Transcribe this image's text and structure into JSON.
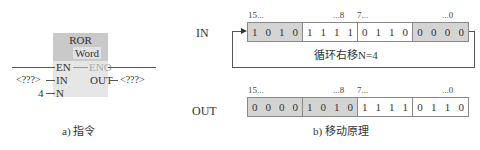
{
  "instruction": {
    "name": "ROR",
    "type": "Word",
    "pins": {
      "en": "EN",
      "eno": "ENO",
      "in": "IN",
      "out": "OUT",
      "n": "N"
    },
    "in_value": "<???>",
    "out_value": "<???>",
    "n_value": "4",
    "caption": "a) 指令"
  },
  "principle": {
    "caption": "b) 移动原理",
    "shift_label": "循环右移N=4",
    "in_row": {
      "label": "IN",
      "headers": [
        "15...",
        "...8",
        "7...",
        "...0"
      ],
      "nibbles": [
        {
          "bits": [
            "1",
            "0",
            "1",
            "0"
          ],
          "shaded": true
        },
        {
          "bits": [
            "1",
            "1",
            "1",
            "1"
          ],
          "shaded": false
        },
        {
          "bits": [
            "0",
            "1",
            "1",
            "0"
          ],
          "shaded": false
        },
        {
          "bits": [
            "0",
            "0",
            "0",
            "0"
          ],
          "shaded": true
        }
      ]
    },
    "out_row": {
      "label": "OUT",
      "headers": [
        "15...",
        "...8",
        "7...",
        "...0"
      ],
      "nibbles": [
        {
          "bits": [
            "0",
            "0",
            "0",
            "0"
          ],
          "shaded": true
        },
        {
          "bits": [
            "1",
            "0",
            "1",
            "0"
          ],
          "shaded": true
        },
        {
          "bits": [
            "1",
            "1",
            "1",
            "1"
          ],
          "shaded": false
        },
        {
          "bits": [
            "0",
            "1",
            "1",
            "0"
          ],
          "shaded": false
        }
      ]
    }
  },
  "colors": {
    "shade": "#d4d4d4",
    "block_head": "#c9c9c9",
    "block_body": "#e6e6e6"
  }
}
